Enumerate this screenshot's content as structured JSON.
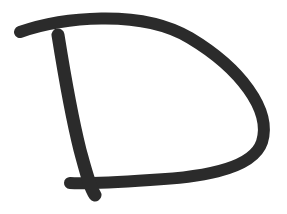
{
  "image": {
    "subject": "Hand-drawn letter D",
    "letter": "D",
    "background_color": "#ffffff",
    "stroke_color": "#2b2b2b",
    "stroke_width": 12
  },
  "strokes": [
    {
      "name": "bowl-stroke",
      "description": "Top bar sweeping right into the curved bowl and back along the bottom",
      "path": "M 20 32 C 60 18, 140 8, 190 38 C 240 68, 272 110, 262 142 C 252 172, 190 178, 150 180 C 120 182, 90 184, 70 183"
    },
    {
      "name": "stem-stroke",
      "description": "Left vertical stem of the D",
      "path": "M 58 35 C 62 60, 70 110, 80 150 C 86 172, 90 188, 95 195"
    }
  ]
}
